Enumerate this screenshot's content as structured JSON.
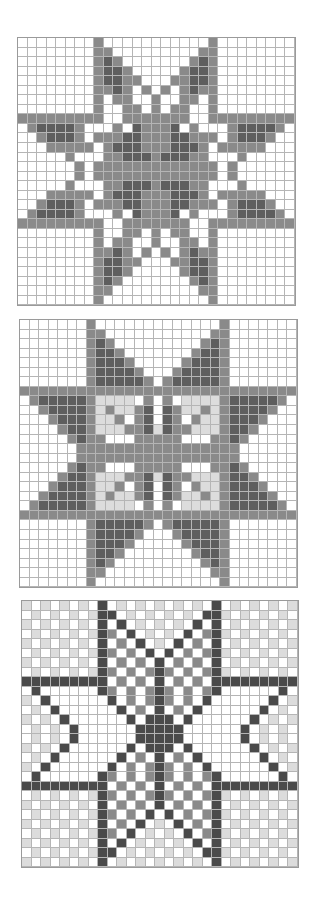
{
  "legend": {
    "w": "#ffffff",
    "l": "#dcdcdc",
    "m": "#8a8a8a",
    "d": "#5e5e5e",
    "k": "#4a4a4a"
  },
  "charts": [
    {
      "name": "star-chart-1",
      "x": 17,
      "y": 37,
      "cols": 29,
      "rows": 28,
      "cell": 9.55,
      "quadrant": [
        "........m......",
        "........mm.....",
        "........mdm....",
        "........mddm...",
        "........mddmm..",
        "........mmdm.m.",
        "........m.mm..m",
        "........m..mm.m",
        "mmmmmmmmm..mmmm",
        ".mddddm...m.dmm",
        "..mdddm.mmmddmm",
        "...mmmmm.mdddmm",
        ".....m...mmdddm",
        "......m.mmmmmmm"
      ]
    },
    {
      "name": "star-chart-2",
      "x": 19,
      "y": 319,
      "cols": 29,
      "rows": 28,
      "cell": 9.55,
      "quadrant": [
        ".......m.......",
        ".......mm......",
        ".......mdm.....",
        ".......mddm....",
        ".......mdddm...",
        ".......mddddm..",
        ".......mdddddm.",
        "mmmmmmmmmmmmmmm",
        ".mdddddmllll.m.",
        "..mddddmlmllmd.",
        "...mdddmllm.md.",
        "....mddmlllmmdl",
        ".....mdmm...mmm",
        "......mmmmmmmmm"
      ]
    },
    {
      "name": "star-chart-3",
      "x": 21,
      "y": 600,
      "cols": 29,
      "rows": 28,
      "cell": 9.5,
      "quadrant": [
        "l.l.l.l.k.l.l.l",
        ".l.l.l.lkk.l.l.",
        "l.l.l.l.k.k.l.l",
        ".l.l.l.lkm.k.l.",
        "l.l.l.l.k.m.k.l",
        ".l.l.l.lkm.m.k.",
        "l.l.l.l.k.m.m.k",
        ".l.l.l.lkm.m.mk",
        "kkkkkkkkk.m.m.k",
        ".k......km.m.mk",
        "l.k......k.m.mk",
        ".l.k......k.m.k",
        "l.l.k......k.kk",
        ".l.l.k......kkk"
      ]
    }
  ]
}
